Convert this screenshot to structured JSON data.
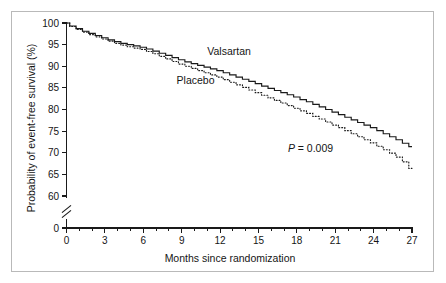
{
  "figure": {
    "background_color": "#ffffff",
    "frame_color": "#b9b9b9",
    "ink_color": "#1a1a1a"
  },
  "annotations": {
    "pvalue_symbol": "P",
    "pvalue_rest": " = 0.009",
    "pvalue_full": "P = 0.009"
  },
  "chart_data": {
    "type": "line",
    "title": "",
    "subtitle": "",
    "xlabel": "Months since randomization",
    "ylabel": "Probability of event-free survival (%)",
    "xlim": [
      0,
      27
    ],
    "ylim": [
      60,
      100
    ],
    "y_axis_break": true,
    "y_axis_break_between": [
      0,
      60
    ],
    "y_zero_tick_label": "0",
    "grid": false,
    "legend_position": "inline-curve-labels",
    "xticks": [
      0,
      3,
      6,
      9,
      12,
      15,
      18,
      21,
      24,
      27
    ],
    "xtick_labels": [
      "0",
      "3",
      "6",
      "9",
      "12",
      "15",
      "18",
      "21",
      "24",
      "27"
    ],
    "x_minor_tick_interval": 1,
    "yticks": [
      60,
      65,
      70,
      75,
      80,
      85,
      90,
      95,
      100
    ],
    "ytick_labels": [
      "60",
      "65",
      "70",
      "75",
      "80",
      "85",
      "90",
      "95",
      "100"
    ],
    "annotations": [
      {
        "text": "P = 0.009",
        "x": 17.3,
        "y": 70.2
      }
    ],
    "series": [
      {
        "name": "Valsartan",
        "style": "solid",
        "label_x": 11.0,
        "label_y": 92.6,
        "x": [
          0,
          0.5,
          1,
          1.5,
          2,
          2.5,
          3,
          3.5,
          4,
          4.5,
          5,
          5.5,
          6,
          6.5,
          7,
          7.5,
          8,
          8.5,
          9,
          9.5,
          10,
          10.5,
          11,
          11.5,
          12,
          12.5,
          13,
          13.5,
          14,
          14.5,
          15,
          15.5,
          16,
          16.5,
          17,
          17.5,
          18,
          18.5,
          19,
          19.5,
          20,
          20.5,
          21,
          21.5,
          22,
          22.5,
          23,
          23.5,
          24,
          24.5,
          25,
          25.5,
          26,
          26.5,
          27
        ],
        "y": [
          100.0,
          99.3,
          98.7,
          98.1,
          97.6,
          97.1,
          96.6,
          96.1,
          95.7,
          95.3,
          95.0,
          94.7,
          94.4,
          94.0,
          93.5,
          93.0,
          92.5,
          92.0,
          91.5,
          91.0,
          90.6,
          90.2,
          89.8,
          89.4,
          89.0,
          88.5,
          88.0,
          87.5,
          87.0,
          86.5,
          86.0,
          85.4,
          84.9,
          84.4,
          83.9,
          83.4,
          82.9,
          82.3,
          81.8,
          81.2,
          80.6,
          80.0,
          79.4,
          78.8,
          78.2,
          77.6,
          77.0,
          76.4,
          75.8,
          75.1,
          74.4,
          73.7,
          73.0,
          72.2,
          71.4
        ]
      },
      {
        "name": "Placebo",
        "style": "dotted",
        "label_x": 8.6,
        "label_y": 86.0,
        "x": [
          0,
          0.5,
          1,
          1.5,
          2,
          2.5,
          3,
          3.5,
          4,
          4.5,
          5,
          5.5,
          6,
          6.5,
          7,
          7.5,
          8,
          8.5,
          9,
          9.5,
          10,
          10.5,
          11,
          11.5,
          12,
          12.5,
          13,
          13.5,
          14,
          14.5,
          15,
          15.5,
          16,
          16.5,
          17,
          17.5,
          18,
          18.5,
          19,
          19.5,
          20,
          20.5,
          21,
          21.5,
          22,
          22.5,
          23,
          23.5,
          24,
          24.5,
          25,
          25.5,
          26,
          26.5,
          27
        ],
        "y": [
          100.0,
          99.2,
          98.5,
          97.9,
          97.3,
          96.8,
          96.3,
          95.8,
          95.3,
          94.9,
          94.5,
          94.2,
          93.9,
          93.4,
          92.9,
          92.3,
          91.7,
          91.1,
          90.5,
          90.0,
          89.5,
          89.0,
          88.5,
          88.0,
          87.5,
          86.9,
          86.3,
          85.7,
          85.1,
          84.5,
          83.9,
          83.3,
          82.7,
          82.1,
          81.5,
          80.9,
          80.3,
          79.7,
          79.1,
          78.4,
          77.8,
          77.1,
          76.4,
          75.8,
          75.1,
          74.4,
          73.7,
          73.0,
          72.3,
          71.5,
          70.7,
          69.9,
          69.0,
          67.9,
          66.4
        ]
      }
    ]
  }
}
